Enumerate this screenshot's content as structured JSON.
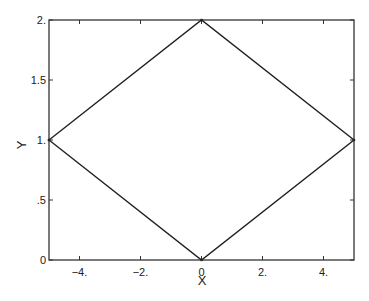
{
  "chart_data": {
    "type": "line",
    "title": "",
    "xlabel": "X",
    "ylabel": "Y",
    "xlim": [
      -5,
      5
    ],
    "ylim": [
      0,
      2
    ],
    "grid": false,
    "legend": "none",
    "x_ticks": [
      -4,
      -2,
      0,
      2,
      4
    ],
    "x_tick_labels": [
      "-4.",
      "-2.",
      "0",
      "2.",
      "4."
    ],
    "y_ticks": [
      0,
      0.5,
      1,
      1.5,
      2
    ],
    "y_tick_labels": [
      "0",
      ".5",
      "1.",
      "1.5",
      "2."
    ],
    "series": [
      {
        "name": "diamond",
        "color": "#222222",
        "x": [
          -5,
          0,
          5,
          0,
          -5
        ],
        "y": [
          1,
          2,
          1,
          0,
          1
        ]
      }
    ]
  }
}
